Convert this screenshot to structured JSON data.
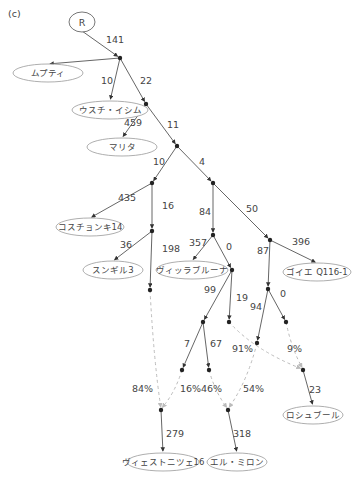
{
  "panel_label": "(c)",
  "root": {
    "label": "R",
    "x": 82,
    "y": 22
  },
  "nodes": [
    {
      "id": "n1",
      "x": 120,
      "y": 58
    },
    {
      "id": "n2",
      "x": 146,
      "y": 104
    },
    {
      "id": "n3",
      "x": 177,
      "y": 146
    },
    {
      "id": "n4",
      "x": 152,
      "y": 183
    },
    {
      "id": "n5",
      "x": 213,
      "y": 183
    },
    {
      "id": "n6",
      "x": 152,
      "y": 231
    },
    {
      "id": "n7",
      "x": 213,
      "y": 235
    },
    {
      "id": "n8",
      "x": 270,
      "y": 240
    },
    {
      "id": "n9",
      "x": 232,
      "y": 270
    },
    {
      "id": "n10",
      "x": 268,
      "y": 289
    },
    {
      "id": "n11",
      "x": 150,
      "y": 290
    },
    {
      "id": "n12",
      "x": 203,
      "y": 322
    },
    {
      "id": "n13",
      "x": 229,
      "y": 322
    },
    {
      "id": "n14",
      "x": 257,
      "y": 343
    },
    {
      "id": "n15",
      "x": 286,
      "y": 322
    },
    {
      "id": "n16",
      "x": 182,
      "y": 370
    },
    {
      "id": "n17",
      "x": 209,
      "y": 370
    },
    {
      "id": "n18",
      "x": 303,
      "y": 370
    },
    {
      "id": "n19",
      "x": 161,
      "y": 410
    },
    {
      "id": "n20",
      "x": 228,
      "y": 410
    }
  ],
  "leaves": [
    {
      "id": "l1",
      "label": "ムプティ",
      "x": 48,
      "y": 73,
      "rx": 35,
      "ry": 9
    },
    {
      "id": "l2",
      "label": "ウスチ・イシム",
      "x": 110,
      "y": 110,
      "rx": 38,
      "ry": 9
    },
    {
      "id": "l3",
      "label": "マリタ",
      "x": 122,
      "y": 147,
      "rx": 35,
      "ry": 9
    },
    {
      "id": "l4",
      "label": "コスチョンキ14",
      "x": 90,
      "y": 227,
      "rx": 34,
      "ry": 9
    },
    {
      "id": "l5",
      "label": "スンギル3",
      "x": 113,
      "y": 270,
      "rx": 30,
      "ry": 9
    },
    {
      "id": "l6",
      "label": "ヴィッラブルーナ",
      "x": 192,
      "y": 270,
      "rx": 36,
      "ry": 9
    },
    {
      "id": "l7",
      "label": "ゴイエ Q116-1",
      "x": 317,
      "y": 272,
      "rx": 34,
      "ry": 9
    },
    {
      "id": "l8",
      "label": "ロシュブール",
      "x": 313,
      "y": 415,
      "rx": 30,
      "ry": 9
    },
    {
      "id": "l9",
      "label": "ヴィェストニツェ16",
      "x": 163,
      "y": 462,
      "rx": 36,
      "ry": 9
    },
    {
      "id": "l10",
      "label": "エル・ミロン",
      "x": 237,
      "y": 462,
      "rx": 30,
      "ry": 9
    }
  ],
  "edges": [
    {
      "from": "root",
      "to": "n1",
      "label": "141",
      "lx": 106,
      "ly": 43
    },
    {
      "from": "n1",
      "to": "l1",
      "label": "",
      "lx": 0,
      "ly": 0
    },
    {
      "from": "n1",
      "to": "n2",
      "label": "22",
      "lx": 140,
      "ly": 84
    },
    {
      "from": "n1",
      "to": "l2",
      "label": "10",
      "lx": 101,
      "ly": 84
    },
    {
      "from": "n2",
      "to": "l3",
      "label": "459",
      "lx": 124,
      "ly": 126
    },
    {
      "from": "n2",
      "to": "n3",
      "label": "11",
      "lx": 167,
      "ly": 128
    },
    {
      "from": "n3",
      "to": "n4",
      "label": "10",
      "lx": 153,
      "ly": 165
    },
    {
      "from": "n3",
      "to": "n5",
      "label": "4",
      "lx": 199,
      "ly": 165
    },
    {
      "from": "n4",
      "to": "l4",
      "label": "435",
      "lx": 118,
      "ly": 201
    },
    {
      "from": "n4",
      "to": "n6",
      "label": "16",
      "lx": 162,
      "ly": 209
    },
    {
      "from": "n6",
      "to": "l5",
      "label": "36",
      "lx": 120,
      "ly": 248
    },
    {
      "from": "n6",
      "to": "n11",
      "label": "198",
      "lx": 162,
      "ly": 252
    },
    {
      "from": "n5",
      "to": "n7",
      "label": "84",
      "lx": 199,
      "ly": 215
    },
    {
      "from": "n5",
      "to": "n8",
      "label": "50",
      "lx": 246,
      "ly": 212
    },
    {
      "from": "n7",
      "to": "l6",
      "label": "357",
      "lx": 189,
      "ly": 246
    },
    {
      "from": "n7",
      "to": "n9",
      "label": "0",
      "lx": 226,
      "ly": 250
    },
    {
      "from": "n8",
      "to": "l7",
      "label": "396",
      "lx": 292,
      "ly": 245
    },
    {
      "from": "n8",
      "to": "n10",
      "label": "87",
      "lx": 257,
      "ly": 254
    },
    {
      "from": "n9",
      "to": "n12",
      "label": "99",
      "lx": 204,
      "ly": 293
    },
    {
      "from": "n9",
      "to": "n13",
      "label": "19",
      "lx": 236,
      "ly": 301
    },
    {
      "from": "n10",
      "to": "n14",
      "label": "94",
      "lx": 250,
      "ly": 310
    },
    {
      "from": "n10",
      "to": "n15",
      "label": "0",
      "lx": 280,
      "ly": 297
    },
    {
      "from": "n12",
      "to": "n16",
      "label": "7",
      "lx": 184,
      "ly": 347
    },
    {
      "from": "n12",
      "to": "n17",
      "label": "67",
      "lx": 210,
      "ly": 347
    },
    {
      "from": "n19",
      "to": "l9",
      "label": "279",
      "lx": 166,
      "ly": 437
    },
    {
      "from": "n20",
      "to": "l10",
      "label": "318",
      "lx": 233,
      "ly": 437
    },
    {
      "from": "n18",
      "to": "l8",
      "label": "23",
      "lx": 309,
      "ly": 393
    }
  ],
  "admixture": [
    {
      "from": "n11",
      "to": "n19",
      "label": "84%",
      "lx": 132,
      "ly": 392
    },
    {
      "from": "n16",
      "to": "n19",
      "label": "16%",
      "lx": 180,
      "ly": 392
    },
    {
      "from": "n17",
      "to": "n20",
      "label": "46%",
      "lx": 201,
      "ly": 392
    },
    {
      "from": "n13",
      "to": "n18",
      "label": "91%",
      "lx": 232,
      "ly": 352
    },
    {
      "from": "n14",
      "to": "n20",
      "label": "54%",
      "lx": 243,
      "ly": 392
    },
    {
      "from": "n15",
      "to": "n18",
      "label": "9%",
      "lx": 287,
      "ly": 352
    }
  ]
}
